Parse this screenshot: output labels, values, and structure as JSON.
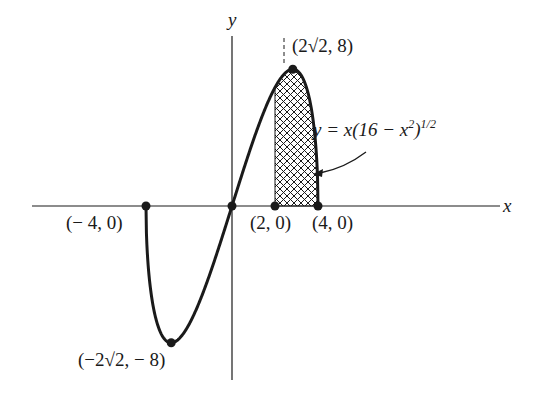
{
  "diagram": {
    "type": "function-graph",
    "function_label": {
      "prefix": "y = x(16 − x",
      "sq": "2",
      "close": ")",
      "exp": "1/2"
    },
    "axes": {
      "x_label": "x",
      "y_label": "y"
    },
    "points": [
      {
        "id": "neg4",
        "label": "(− 4, 0)",
        "x": -4,
        "y": 0
      },
      {
        "id": "origin",
        "label": "",
        "x": 0,
        "y": 0
      },
      {
        "id": "two",
        "label": "(2, 0)",
        "x": 2,
        "y": 0
      },
      {
        "id": "four",
        "label": "(4, 0)",
        "x": 4,
        "y": 0
      },
      {
        "id": "max",
        "label": "(2√2, 8)",
        "x": 2.828,
        "y": 8
      },
      {
        "id": "min",
        "label": "(−2√2, − 8)",
        "x": -2.828,
        "y": -8
      }
    ],
    "shaded_region": {
      "pattern": "crosshatch",
      "x_from": 2,
      "x_to": 4
    },
    "colors": {
      "ink": "#1a1a1a",
      "background": "#ffffff"
    }
  }
}
